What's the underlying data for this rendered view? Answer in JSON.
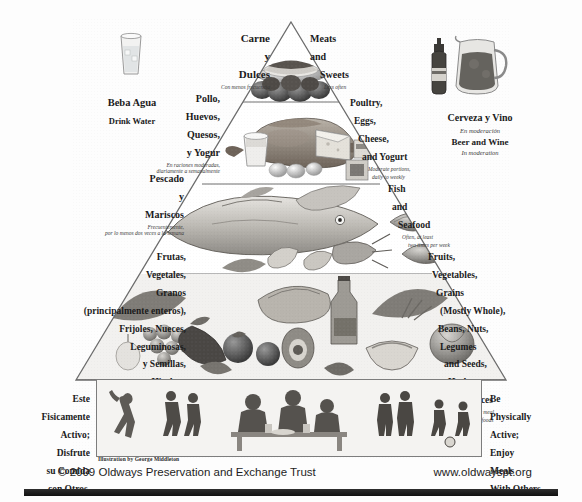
{
  "poster": {
    "title": "Mediterranean Diet Pyramid",
    "illustration_credit": "Illustration by George Middleton",
    "copyright": "© 2009 Oldways Preservation and Exchange Trust",
    "website": "www.oldwayspt.org"
  },
  "side_icons": {
    "water": {
      "icon": "water-glass-icon",
      "label_es": "Beba Agua",
      "label_en": "Drink Water"
    },
    "drinks": {
      "icon": "beer-bottle-and-wine-pitcher-icon",
      "label_es": "Cerveza y Vino",
      "sub_es": "En moderación",
      "label_en": "Beer and Wine",
      "sub_en": "In moderation"
    }
  },
  "tiers": [
    {
      "id": "meats-sweets",
      "es_title": "Carne\ny\nDulces",
      "es_title_lines": [
        "Carne",
        "y",
        "Dulces"
      ],
      "es_sub": "Con menos frecuencia",
      "en_title_lines": [
        "Meats",
        "and",
        "Sweets"
      ],
      "en_sub": "Less often",
      "foods": "cake, chocolates, pastries"
    },
    {
      "id": "poultry-eggs-cheese-yogurt",
      "es_title_lines": [
        "Pollo,",
        "Huevos,",
        "Quesos,",
        "y Yogur"
      ],
      "es_sub": "En raciones moderadas,\ndiariamente a semanalmente",
      "es_sub_lines": [
        "En raciones moderadas,",
        "diariamente a semanalmente"
      ],
      "en_title_lines": [
        "Poultry,",
        "Eggs,",
        "Cheese,",
        "and Yogurt"
      ],
      "en_sub_lines": [
        "Moderate portions,",
        "daily to weekly"
      ],
      "foods": "roast chicken, eggs, cheese wedge, yogurt glass, butter"
    },
    {
      "id": "fish-seafood",
      "es_title_lines": [
        "Pescado",
        "y",
        "Mariscos"
      ],
      "es_sub_lines": [
        "Frecuentemente,",
        "por lo menos dos veces a la semana"
      ],
      "en_title_lines": [
        "Fish",
        "and",
        "Seafood"
      ],
      "en_sub_lines": [
        "Often, at least",
        "two times per week"
      ],
      "foods": "whole fish, shrimp, lobster, scallops, clam shell"
    },
    {
      "id": "plant-foods-base",
      "es_title_lines": [
        "Frutas,",
        "Vegetales,",
        "Granos",
        "(principalmente enteros),",
        "Frijoles, Nueces,",
        "Leguminosas,",
        "y Semillas,",
        "Hierbas,",
        "y Especias"
      ],
      "es_sub_lines": [
        "Base cada alimentación",
        "en estas comidas"
      ],
      "en_title_lines": [
        "Fruits,",
        "Vegetables,",
        "Grains",
        "(Mostly Whole),",
        "Beans, Nuts,",
        "Legumes",
        "and Seeds,",
        "Herbs,",
        "and Spices"
      ],
      "en_sub_lines": [
        "Base every meal",
        "on these foods"
      ],
      "foods": "grapes, tomatoes, eggplant, bread, olive oil, pasta, greens, peppers, beans"
    },
    {
      "id": "activity-base",
      "es_title_lines": [
        "Este",
        "Fisicamente",
        "Activo;",
        "Disfrute",
        "su Comida",
        "con Otros."
      ],
      "en_title_lines": [
        "Be",
        "Physically",
        "Active;",
        "Enjoy",
        "Meals",
        "With Others."
      ],
      "scene": "people dancing, walking, sharing a meal and playing soccer"
    }
  ],
  "colors": {
    "ink": "#1b1b1b",
    "line": "#6f6f6f",
    "paper": "#fdfdfd",
    "bar": "#1a1a1a"
  }
}
